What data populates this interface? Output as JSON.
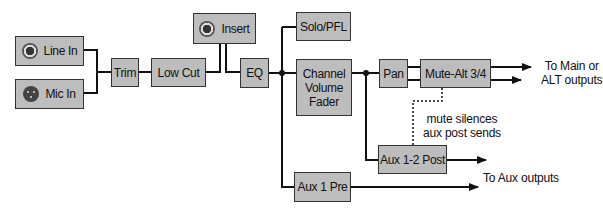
{
  "diagram": {
    "blocks": {
      "line_in": "Line In",
      "mic_in": "Mic In",
      "trim": "Trim",
      "low_cut": "Low Cut",
      "insert": "Insert",
      "eq": "EQ",
      "solo_pfl": "Solo/PFL",
      "fader_l1": "Channel",
      "fader_l2": "Volume",
      "fader_l3": "Fader",
      "pan": "Pan",
      "mute_alt": "Mute-Alt 3/4",
      "aux_post": "Aux 1-2 Post",
      "aux_pre": "Aux 1 Pre"
    },
    "labels": {
      "main_out_l1": "To Main or",
      "main_out_l2": "ALT outputs",
      "mute_note_l1": "mute silences",
      "mute_note_l2": "aux post sends",
      "aux_out": "To Aux outputs"
    },
    "icons": {
      "line_in": "trs-jack-icon",
      "mic_in": "xlr-connector-icon",
      "insert": "trs-jack-icon"
    },
    "colors": {
      "block_fill": "#bdbdbd",
      "line": "#111111",
      "background": "#ffffff"
    }
  }
}
